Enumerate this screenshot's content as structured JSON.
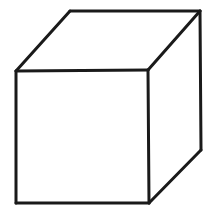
{
  "figure": {
    "canvas": {
      "width": 214,
      "height": 216,
      "background_color": "#ffffff"
    },
    "stroke": {
      "color": "#1a1a1a",
      "width": 3,
      "linecap": "round",
      "linejoin": "round"
    },
    "face_fill_color": "#ffffff",
    "vertices": {
      "front_top_left": {
        "x": 16,
        "y": 71
      },
      "front_top_right": {
        "x": 148,
        "y": 70
      },
      "front_bottom_right": {
        "x": 149,
        "y": 203
      },
      "front_bottom_left": {
        "x": 16,
        "y": 203
      },
      "back_top_left": {
        "x": 70,
        "y": 11
      },
      "back_top_right": {
        "x": 200,
        "y": 11
      },
      "back_bottom_right": {
        "x": 201,
        "y": 150
      }
    },
    "faces": {
      "front": "16,71 148,70 149,203 16,203",
      "top": "16,71 70,11 200,11 148,70",
      "right": "148,70 200,11 201,150 149,203"
    },
    "edges": [
      {
        "name": "front-top-edge",
        "path": "M 16,71 L 148,70"
      },
      {
        "name": "front-right-edge",
        "path": "M 148,70 L 149,203"
      },
      {
        "name": "front-bottom-edge",
        "path": "M 149,203 L 16,203"
      },
      {
        "name": "front-left-edge",
        "path": "M 16,203 L 16,71"
      },
      {
        "name": "top-left-receding-edge",
        "path": "M 16,71 L 70,11"
      },
      {
        "name": "top-back-edge",
        "path": "M 70,11 L 200,11"
      },
      {
        "name": "top-right-receding-edge",
        "path": "M 200,11 L 148,70"
      },
      {
        "name": "back-right-vertical-edge",
        "path": "M 200,11 L 201,150"
      },
      {
        "name": "bottom-right-receding-edge",
        "path": "M 201,150 L 149,203"
      }
    ]
  }
}
